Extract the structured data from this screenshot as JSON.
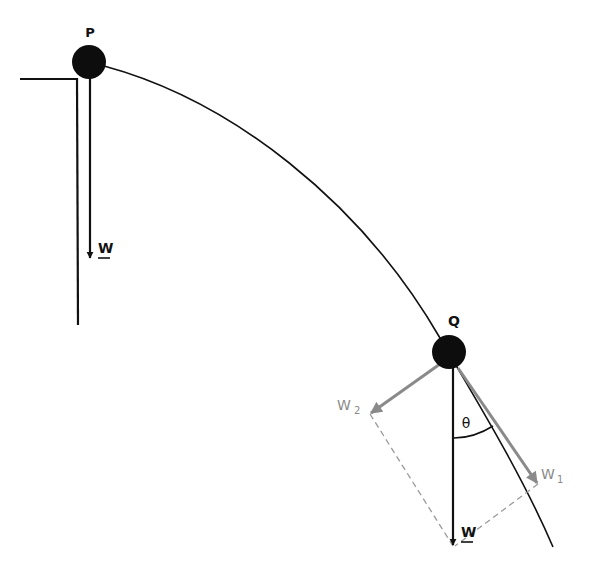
{
  "diagram": {
    "type": "physics-free-body",
    "points": [
      {
        "id": "P",
        "label": "P"
      },
      {
        "id": "Q",
        "label": "Q"
      }
    ],
    "vectors": [
      {
        "id": "W_at_P",
        "label": "W",
        "underlined": true,
        "color": "#111111"
      },
      {
        "id": "W_at_Q",
        "label": "W",
        "underlined": true,
        "color": "#111111"
      },
      {
        "id": "W1",
        "label": "W",
        "subscript": "1",
        "color": "#8a8a8a"
      },
      {
        "id": "W2",
        "label": "W",
        "subscript": "2",
        "color": "#8a8a8a"
      }
    ],
    "angle": {
      "label": "θ",
      "between": [
        "W_at_Q",
        "W1"
      ]
    },
    "colors": {
      "ink": "#111111",
      "component": "#8a8a8a",
      "dashed": "#9a9a9a",
      "background": "#ffffff"
    }
  }
}
